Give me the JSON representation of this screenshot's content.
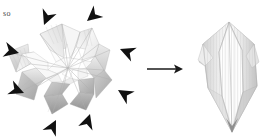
{
  "figure": {
    "background_color": "#ffffff",
    "caption": {
      "text": "so"
    },
    "panels": [
      {
        "id": "left-panel",
        "name": "star-origami-model",
        "description": "Star / flower shaped collapsed origami paper model with eight radiating points",
        "paper_colors": {
          "highlight": "#ffffff",
          "light": "#f2f2f2",
          "mid": "#dcdcdc",
          "shade": "#bdbdbd",
          "deep_shade": "#9e9e9e",
          "crease": "#a8a8a8"
        },
        "arrow_color": "#111111",
        "arrow_count": 8,
        "arrows": [
          {
            "name": "arrow-top-left",
            "x": 42,
            "y": 23,
            "rotation": 115
          },
          {
            "name": "arrow-top-right",
            "x": 85,
            "y": 19,
            "rotation": 145
          },
          {
            "name": "arrow-right-upper",
            "x": 118,
            "y": 47,
            "rotation": 205
          },
          {
            "name": "arrow-right-lower",
            "x": 117,
            "y": 88,
            "rotation": 215
          },
          {
            "name": "arrow-bottom-right",
            "x": 88,
            "y": 112,
            "rotation": 290
          },
          {
            "name": "arrow-bottom-left",
            "x": 55,
            "y": 118,
            "rotation": 300
          },
          {
            "name": "arrow-left-lower",
            "x": 25,
            "y": 92,
            "rotation": 20
          },
          {
            "name": "arrow-left-upper",
            "x": 20,
            "y": 52,
            "rotation": 15
          }
        ]
      },
      {
        "id": "transition-arrow",
        "name": "process-arrow",
        "description": "Horizontal arrow indicating the fold/collapse transition",
        "color": "#1a1a1a",
        "x1": 147,
        "y1": 69,
        "x2": 182,
        "y2": 69
      },
      {
        "id": "right-panel",
        "name": "collapsed-diamond-model",
        "description": "Vertically elongated hexagonal diamond folded paper model with vertical pleats",
        "paper_colors": {
          "highlight": "#ffffff",
          "light": "#f4f4f4",
          "mid": "#e4e4e4",
          "shade": "#cfcfcf",
          "deep_shade": "#b4b4b4",
          "crease": "#b0b0b0"
        }
      }
    ]
  }
}
